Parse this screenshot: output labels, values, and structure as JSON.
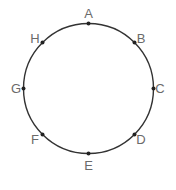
{
  "diagram": {
    "type": "circle-with-labeled-points",
    "circle": {
      "cx": 88.5,
      "cy": 88.5,
      "r": 65,
      "stroke": "#333333",
      "stroke_width": 1.4
    },
    "point_color": "#222222",
    "label_color": "#6a6a6a",
    "points": [
      {
        "label": "A",
        "x": 88.5,
        "y": 23.5,
        "lx": 88.5,
        "ly": 18
      },
      {
        "label": "B",
        "x": 134.5,
        "y": 42.5,
        "lx": 141,
        "ly": 43
      },
      {
        "label": "C",
        "x": 153.5,
        "y": 88.5,
        "lx": 160,
        "ly": 93
      },
      {
        "label": "D",
        "x": 134.5,
        "y": 134.5,
        "lx": 141,
        "ly": 144
      },
      {
        "label": "E",
        "x": 88.5,
        "y": 153.5,
        "lx": 88.5,
        "ly": 170
      },
      {
        "label": "F",
        "x": 42.5,
        "y": 134.5,
        "lx": 35,
        "ly": 144
      },
      {
        "label": "G",
        "x": 23.5,
        "y": 88.5,
        "lx": 16,
        "ly": 93
      },
      {
        "label": "H",
        "x": 42.5,
        "y": 42.5,
        "lx": 35,
        "ly": 43
      }
    ]
  }
}
